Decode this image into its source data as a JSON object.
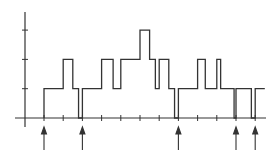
{
  "figure": {
    "type": "step-function-diagram",
    "colors": {
      "line": "#333333",
      "background": "#ffffff"
    },
    "axes": {
      "y_levels": [
        0,
        1,
        2,
        3
      ],
      "x_tick_count": 12
    },
    "step_profile": [
      {
        "x0": 0,
        "x1": 1,
        "level": 1
      },
      {
        "x0": 1,
        "x1": 1.5,
        "level": 2
      },
      {
        "x0": 1.5,
        "x1": 1.8,
        "level": 1
      },
      {
        "x0": 1.8,
        "x1": 2,
        "level": 0
      },
      {
        "x0": 2,
        "x1": 3,
        "level": 1
      },
      {
        "x0": 3,
        "x1": 3.6,
        "level": 2
      },
      {
        "x0": 3.6,
        "x1": 4,
        "level": 1
      },
      {
        "x0": 4,
        "x1": 5,
        "level": 2
      },
      {
        "x0": 5,
        "x1": 5.5,
        "level": 3
      },
      {
        "x0": 5.5,
        "x1": 5.8,
        "level": 2
      },
      {
        "x0": 5.8,
        "x1": 6,
        "level": 1
      },
      {
        "x0": 6,
        "x1": 6.5,
        "level": 2
      },
      {
        "x0": 6.5,
        "x1": 6.8,
        "level": 1
      },
      {
        "x0": 6.8,
        "x1": 7,
        "level": 0
      },
      {
        "x0": 7,
        "x1": 8,
        "level": 1
      },
      {
        "x0": 8,
        "x1": 8.4,
        "level": 2
      },
      {
        "x0": 8.4,
        "x1": 9,
        "level": 1
      },
      {
        "x0": 9,
        "x1": 9.2,
        "level": 2
      },
      {
        "x0": 9.2,
        "x1": 9.9,
        "level": 1
      },
      {
        "x0": 9.9,
        "x1": 10,
        "level": 0
      },
      {
        "x0": 10,
        "x1": 10.8,
        "level": 1
      },
      {
        "x0": 10.8,
        "x1": 11,
        "level": 0
      },
      {
        "x0": 11,
        "x1": 11.5,
        "level": 1
      }
    ],
    "arrow_positions": [
      0,
      2,
      7,
      10,
      11
    ]
  }
}
